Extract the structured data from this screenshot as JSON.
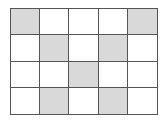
{
  "grid": {
    "rows": 4,
    "cols": 5,
    "shaded_color": "#d9d9d9",
    "line_color": "#555555",
    "cells": [
      [
        1,
        0,
        0,
        0,
        1
      ],
      [
        0,
        1,
        0,
        1,
        0
      ],
      [
        0,
        0,
        1,
        0,
        0
      ],
      [
        0,
        1,
        0,
        1,
        0
      ]
    ]
  }
}
